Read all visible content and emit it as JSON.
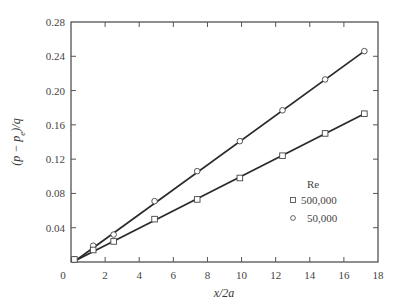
{
  "chart_data": {
    "type": "line",
    "title": "",
    "xlabel": "x/2a",
    "ylabel": "(p − p_e)/q",
    "xlim": [
      0,
      18
    ],
    "ylim": [
      0,
      0.28
    ],
    "x_ticks": [
      0,
      2,
      4,
      6,
      8,
      10,
      12,
      14,
      16,
      18
    ],
    "x_tick_labels": [
      "0",
      "2",
      "4",
      "6",
      "8",
      "10",
      "12",
      "14",
      "16",
      "18"
    ],
    "y_ticks": [
      0.04,
      0.08,
      0.12,
      0.16,
      0.2,
      0.24,
      0.28
    ],
    "y_tick_labels": [
      "0.04",
      "0.08",
      "0.12",
      "0.16",
      "0.20",
      "0.24",
      "0.28"
    ],
    "grid": false,
    "legend": {
      "title": "Re",
      "position": "lower right inside",
      "entries": [
        {
          "marker": "square",
          "label": "500,000"
        },
        {
          "marker": "circle",
          "label": "50,000"
        }
      ]
    },
    "series": [
      {
        "name": "50,000",
        "marker": "circle",
        "x": [
          0.2,
          1.3,
          2.5,
          4.9,
          7.4,
          9.9,
          12.4,
          14.9,
          17.2
        ],
        "y": [
          0.003,
          0.019,
          0.032,
          0.071,
          0.106,
          0.141,
          0.177,
          0.213,
          0.246
        ],
        "fit_line": {
          "x": [
            0.3,
            17.2
          ],
          "y": [
            0.002,
            0.246
          ]
        }
      },
      {
        "name": "500,000",
        "marker": "square",
        "x": [
          0.2,
          1.3,
          2.5,
          4.9,
          7.4,
          9.9,
          12.4,
          14.9,
          17.2
        ],
        "y": [
          0.003,
          0.014,
          0.024,
          0.05,
          0.073,
          0.098,
          0.124,
          0.15,
          0.173
        ],
        "fit_line": {
          "x": [
            0.3,
            17.2
          ],
          "y": [
            0.002,
            0.173
          ]
        }
      }
    ]
  }
}
